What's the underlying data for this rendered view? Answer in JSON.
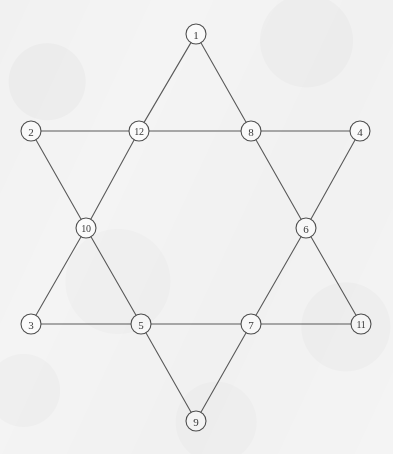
{
  "figure": {
    "width": 393,
    "height": 454,
    "background_color": "#f4f4f4",
    "edge_color": "#5a5a5a",
    "edge_width": 1.1,
    "node_fill": "#fbfbfb",
    "node_stroke": "#4f4f4f",
    "node_stroke_width": 1.1,
    "node_radius": 10,
    "label_color": "#3a3a3a"
  },
  "chart_data": {
    "type": "diagram",
    "subtype": "node-link-graph",
    "node_count": 12,
    "edge_count": 18,
    "nodes": [
      {
        "id": 1,
        "label": "1",
        "x": 196,
        "y": 34,
        "role": "outer-point-top"
      },
      {
        "id": 2,
        "label": "2",
        "x": 31,
        "y": 131,
        "role": "outer-point-upper-left"
      },
      {
        "id": 3,
        "label": "3",
        "x": 31,
        "y": 324,
        "role": "outer-point-lower-left"
      },
      {
        "id": 4,
        "label": "4",
        "x": 360,
        "y": 131,
        "role": "outer-point-upper-right"
      },
      {
        "id": 5,
        "label": "5",
        "x": 141,
        "y": 324,
        "role": "inner-hexagon-bottom-left"
      },
      {
        "id": 6,
        "label": "6",
        "x": 306,
        "y": 228,
        "role": "inner-hexagon-right"
      },
      {
        "id": 7,
        "label": "7",
        "x": 251,
        "y": 324,
        "role": "inner-hexagon-bottom-right"
      },
      {
        "id": 8,
        "label": "8",
        "x": 251,
        "y": 131,
        "role": "inner-hexagon-top-right"
      },
      {
        "id": 9,
        "label": "9",
        "x": 196,
        "y": 421,
        "role": "outer-point-bottom"
      },
      {
        "id": 10,
        "label": "10",
        "x": 86,
        "y": 228,
        "role": "inner-hexagon-left"
      },
      {
        "id": 11,
        "label": "11",
        "x": 361,
        "y": 324,
        "role": "outer-point-lower-right"
      },
      {
        "id": 12,
        "label": "12",
        "x": 139,
        "y": 131,
        "role": "inner-hexagon-top-left"
      }
    ],
    "edges": [
      {
        "source": 1,
        "target": 12
      },
      {
        "source": 1,
        "target": 8
      },
      {
        "source": 2,
        "target": 12
      },
      {
        "source": 2,
        "target": 10
      },
      {
        "source": 12,
        "target": 8
      },
      {
        "source": 12,
        "target": 10
      },
      {
        "source": 8,
        "target": 4
      },
      {
        "source": 8,
        "target": 6
      },
      {
        "source": 4,
        "target": 6
      },
      {
        "source": 10,
        "target": 3
      },
      {
        "source": 10,
        "target": 5
      },
      {
        "source": 6,
        "target": 7
      },
      {
        "source": 6,
        "target": 11
      },
      {
        "source": 3,
        "target": 5
      },
      {
        "source": 5,
        "target": 7
      },
      {
        "source": 5,
        "target": 9
      },
      {
        "source": 7,
        "target": 11
      },
      {
        "source": 7,
        "target": 9
      }
    ],
    "triangles": [
      {
        "name": "upward-triangle",
        "vertices": [
          1,
          3,
          11
        ]
      },
      {
        "name": "downward-triangle",
        "vertices": [
          2,
          4,
          9
        ]
      }
    ],
    "inner_hexagon": [
      12,
      8,
      6,
      7,
      5,
      10
    ]
  }
}
